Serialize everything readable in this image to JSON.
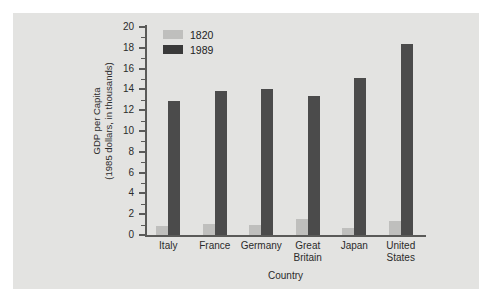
{
  "chart_data": {
    "type": "bar",
    "title": "",
    "xlabel": "Country",
    "ylabel": "GDP per Capita\n(1985 dollars, in thousands)",
    "ylabel_line1": "GDP per Capita",
    "ylabel_line2": "(1985 dollars, in thousands)",
    "categories": [
      "Italy",
      "France",
      "Germany",
      "Great Britain",
      "Japan",
      "United States"
    ],
    "category_lines": [
      [
        "Italy"
      ],
      [
        "France"
      ],
      [
        "Germany"
      ],
      [
        "Great",
        "Britain"
      ],
      [
        "Japan"
      ],
      [
        "United",
        "States"
      ]
    ],
    "series": [
      {
        "name": "1820",
        "color": "#bfbfbd",
        "values": [
          0.9,
          1.1,
          1.0,
          1.5,
          0.7,
          1.3
        ]
      },
      {
        "name": "1989",
        "color": "#4b4b4b",
        "values": [
          12.9,
          13.8,
          14.0,
          13.4,
          15.1,
          18.4
        ]
      }
    ],
    "ylim": [
      0,
      20
    ],
    "ytick_values": [
      0,
      2,
      4,
      6,
      8,
      10,
      12,
      14,
      16,
      18,
      20
    ],
    "ytick_labels": [
      "0",
      "2",
      "4",
      "6",
      "8",
      "10",
      "12",
      "14",
      "16",
      "18",
      "20"
    ],
    "yminor_values": [
      1,
      3,
      5,
      7,
      9,
      11,
      13,
      15,
      17,
      19
    ],
    "grid": false,
    "legend_position": "top-left-inside",
    "legend_entries": [
      "1820",
      "1989"
    ],
    "panel_background": "#e3e3e1",
    "figure_background": "#ffffff",
    "axis_color": "#5a5a58"
  }
}
